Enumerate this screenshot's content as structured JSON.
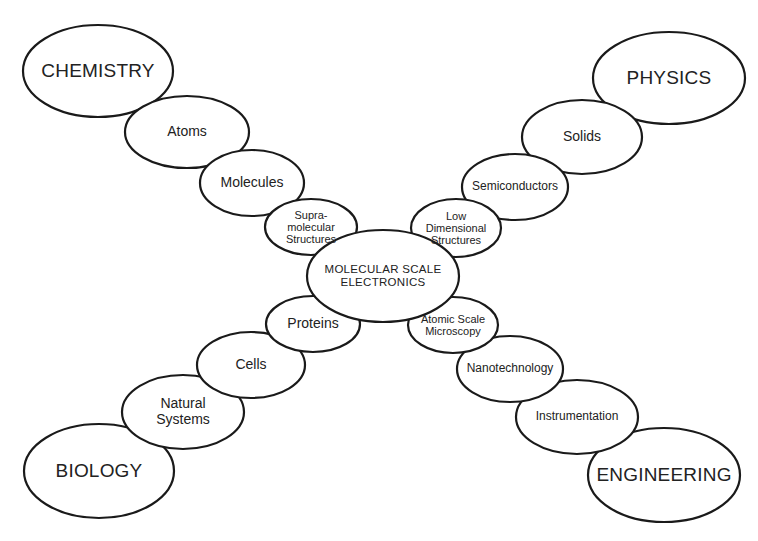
{
  "diagram": {
    "stroke_color": "#1a1a1a",
    "fill_color": "#ffffff",
    "text_color": "#222222",
    "center": {
      "id": "center",
      "label": "MOLECULAR  SCALE\nELECTRONICS",
      "cx": 383,
      "cy": 276,
      "rx": 76,
      "ry": 46
    },
    "branches": [
      {
        "name": "chemistry",
        "nodes": [
          {
            "id": "supramolecular",
            "label": "Supra-\nmolecular\nStructures",
            "cx": 311,
            "cy": 227,
            "rx": 46,
            "ry": 28,
            "size": "xs"
          },
          {
            "id": "molecules",
            "label": "Molecules",
            "cx": 252,
            "cy": 183,
            "rx": 52,
            "ry": 33,
            "size": "md"
          },
          {
            "id": "atoms",
            "label": "Atoms",
            "cx": 187,
            "cy": 132,
            "rx": 62,
            "ry": 36,
            "size": "md"
          },
          {
            "id": "chemistry",
            "label": "CHEMISTRY",
            "cx": 98,
            "cy": 71,
            "rx": 75,
            "ry": 46,
            "size": "lg"
          }
        ]
      },
      {
        "name": "physics",
        "nodes": [
          {
            "id": "low-dimensional",
            "label": "Low\nDimensional\nStructures",
            "cx": 456,
            "cy": 228,
            "rx": 45,
            "ry": 29,
            "size": "xs"
          },
          {
            "id": "semiconductors",
            "label": "Semiconductors",
            "cx": 515,
            "cy": 187,
            "rx": 53,
            "ry": 33,
            "size": "sm"
          },
          {
            "id": "solids",
            "label": "Solids",
            "cx": 582,
            "cy": 137,
            "rx": 60,
            "ry": 37,
            "size": "md"
          },
          {
            "id": "physics",
            "label": "PHYSICS",
            "cx": 669,
            "cy": 78,
            "rx": 76,
            "ry": 46,
            "size": "lg"
          }
        ]
      },
      {
        "name": "biology",
        "nodes": [
          {
            "id": "proteins",
            "label": "Proteins",
            "cx": 313,
            "cy": 324,
            "rx": 47,
            "ry": 28,
            "size": "md"
          },
          {
            "id": "cells",
            "label": "Cells",
            "cx": 251,
            "cy": 365,
            "rx": 54,
            "ry": 33,
            "size": "md"
          },
          {
            "id": "natural-systems",
            "label": "Natural\nSystems",
            "cx": 183,
            "cy": 412,
            "rx": 61,
            "ry": 37,
            "size": "md"
          },
          {
            "id": "biology",
            "label": "BIOLOGY",
            "cx": 99,
            "cy": 471,
            "rx": 75,
            "ry": 47,
            "size": "lg"
          }
        ]
      },
      {
        "name": "engineering",
        "nodes": [
          {
            "id": "atomic-scale-microscopy",
            "label": "Atomic Scale\nMicroscopy",
            "cx": 453,
            "cy": 325,
            "rx": 45,
            "ry": 28,
            "size": "xs"
          },
          {
            "id": "nanotechnology",
            "label": "Nanotechnology",
            "cx": 510,
            "cy": 369,
            "rx": 53,
            "ry": 33,
            "size": "sm"
          },
          {
            "id": "instrumentation",
            "label": "Instrumentation",
            "cx": 577,
            "cy": 417,
            "rx": 61,
            "ry": 37,
            "size": "sm"
          },
          {
            "id": "engineering",
            "label": "ENGINEERING",
            "cx": 664,
            "cy": 475,
            "rx": 76,
            "ry": 47,
            "size": "lg"
          }
        ]
      }
    ]
  }
}
